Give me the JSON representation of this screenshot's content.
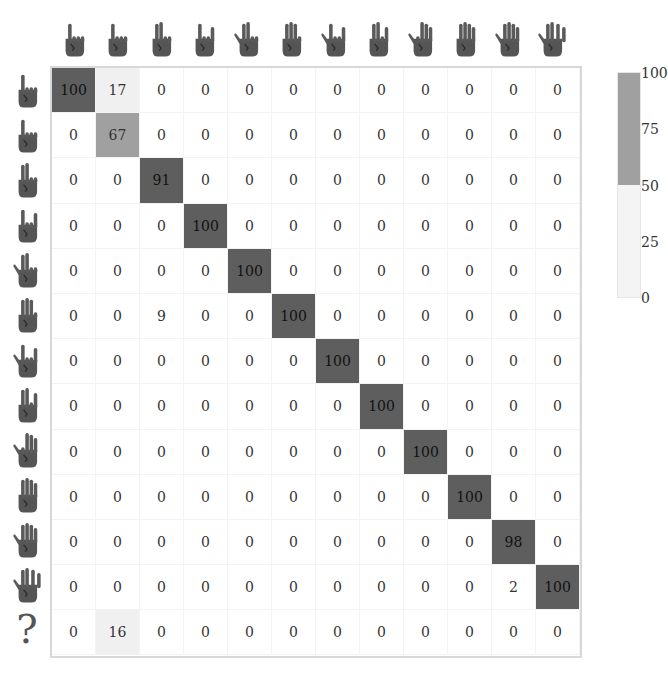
{
  "chart_data": {
    "type": "heatmap",
    "title": "",
    "xlabel": "",
    "ylabel": "",
    "x_categories": [
      "gesture-1",
      "gesture-2",
      "gesture-3",
      "gesture-4",
      "gesture-5",
      "gesture-6",
      "gesture-7",
      "gesture-8",
      "gesture-9",
      "gesture-10",
      "gesture-11",
      "gesture-12"
    ],
    "y_categories": [
      "gesture-1",
      "gesture-2",
      "gesture-3",
      "gesture-4",
      "gesture-5",
      "gesture-6",
      "gesture-7",
      "gesture-8",
      "gesture-9",
      "gesture-10",
      "gesture-11",
      "gesture-12",
      "?"
    ],
    "values": [
      [
        100,
        17,
        0,
        0,
        0,
        0,
        0,
        0,
        0,
        0,
        0,
        0
      ],
      [
        0,
        67,
        0,
        0,
        0,
        0,
        0,
        0,
        0,
        0,
        0,
        0
      ],
      [
        0,
        0,
        91,
        0,
        0,
        0,
        0,
        0,
        0,
        0,
        0,
        0
      ],
      [
        0,
        0,
        0,
        100,
        0,
        0,
        0,
        0,
        0,
        0,
        0,
        0
      ],
      [
        0,
        0,
        0,
        0,
        100,
        0,
        0,
        0,
        0,
        0,
        0,
        0
      ],
      [
        0,
        0,
        9,
        0,
        0,
        100,
        0,
        0,
        0,
        0,
        0,
        0
      ],
      [
        0,
        0,
        0,
        0,
        0,
        0,
        100,
        0,
        0,
        0,
        0,
        0
      ],
      [
        0,
        0,
        0,
        0,
        0,
        0,
        0,
        100,
        0,
        0,
        0,
        0
      ],
      [
        0,
        0,
        0,
        0,
        0,
        0,
        0,
        0,
        100,
        0,
        0,
        0
      ],
      [
        0,
        0,
        0,
        0,
        0,
        0,
        0,
        0,
        0,
        100,
        0,
        0
      ],
      [
        0,
        0,
        0,
        0,
        0,
        0,
        0,
        0,
        0,
        0,
        98,
        0
      ],
      [
        0,
        0,
        0,
        0,
        0,
        0,
        0,
        0,
        0,
        0,
        2,
        100
      ],
      [
        0,
        16,
        0,
        0,
        0,
        0,
        0,
        0,
        0,
        0,
        0,
        0
      ]
    ],
    "colorbar": {
      "ticks": [
        "100",
        "75",
        "50",
        "25",
        "0"
      ],
      "range": [
        0,
        100
      ]
    },
    "colors": {
      "high": "#5e5e5e",
      "mid": "#a0a0a0",
      "low": "#f0f0f0",
      "zero": "#ffffff"
    },
    "row_unknown_label": "?"
  }
}
